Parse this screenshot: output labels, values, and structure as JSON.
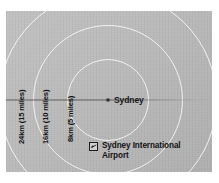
{
  "figure": {
    "kind": "distance-ring-map",
    "background_color": "#ffffff",
    "plate_color": "#b9b9b9",
    "ring_color": "#ffffff",
    "line_color": "#464646",
    "text_color": "#141414"
  },
  "center": {
    "city_label": "Sydney",
    "marker": "city-dot",
    "x": 108,
    "y": 100
  },
  "rings": [
    {
      "id": "8km",
      "label": "8km (5 miles)",
      "km": 8,
      "miles": 5,
      "radius_px": 41
    },
    {
      "id": "16km",
      "label": "16km (10 miles)",
      "km": 16,
      "miles": 10,
      "radius_px": 75
    },
    {
      "id": "24km",
      "label": "24km (15 miles)",
      "km": 24,
      "miles": 15,
      "radius_px": 109
    }
  ],
  "reference_line": {
    "name": "latitude-line",
    "orientation": "horizontal"
  },
  "legend": {
    "items": [
      {
        "icon": "airport-icon",
        "label": "Sydney International Airport"
      }
    ]
  }
}
